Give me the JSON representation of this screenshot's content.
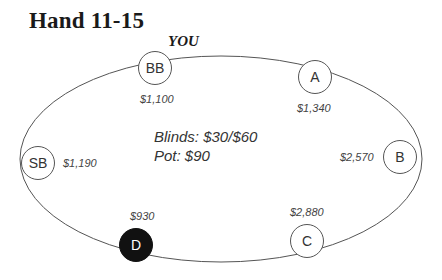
{
  "title": "Hand 11-15",
  "hero_label": "YOU",
  "table": {
    "blinds": "Blinds: $30/$60",
    "pot": "Pot: $90"
  },
  "seats": [
    {
      "id": "BB",
      "label": "BB",
      "stack": "$1,100",
      "is_hero": true,
      "is_dealer": false
    },
    {
      "id": "A",
      "label": "A",
      "stack": "$1,340",
      "is_hero": false,
      "is_dealer": false
    },
    {
      "id": "B",
      "label": "B",
      "stack": "$2,570",
      "is_hero": false,
      "is_dealer": false
    },
    {
      "id": "C",
      "label": "C",
      "stack": "$2,880",
      "is_hero": false,
      "is_dealer": false
    },
    {
      "id": "D",
      "label": "D",
      "stack": "$930",
      "is_hero": false,
      "is_dealer": true
    },
    {
      "id": "SB",
      "label": "SB",
      "stack": "$1,190",
      "is_hero": false,
      "is_dealer": false
    }
  ],
  "colors": {
    "line": "#555555",
    "dealer_fill": "#111111",
    "text": "#333333"
  }
}
